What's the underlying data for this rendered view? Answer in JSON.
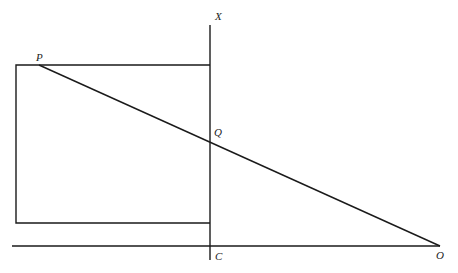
{
  "diagram": {
    "labels": {
      "X": "X",
      "P": "P",
      "Q": "Q",
      "C": "C",
      "O": "O"
    },
    "points": {
      "P": [
        39,
        65
      ],
      "Q": [
        210,
        141
      ],
      "C": [
        210,
        246
      ],
      "O": [
        440,
        246
      ],
      "X": [
        210,
        25
      ]
    },
    "elements": [
      "vertical line XC",
      "rectangle attached to line XC with top-left corner near P",
      "line from P through Q to O",
      "horizontal baseline through C to O"
    ]
  }
}
